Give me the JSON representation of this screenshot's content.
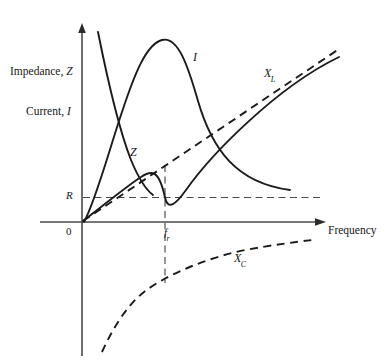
{
  "figure": {
    "type": "diagram",
    "title": "",
    "background_color": "#ffffff",
    "line_color": "#161616",
    "axis_color": "#4a4a4a"
  },
  "axes": {
    "x_axis": {
      "label": "Frequency",
      "arrow": true,
      "origin_label": "0"
    },
    "y_axis": {
      "labels": [
        {
          "text_static": "Impedance, ",
          "variable": "Z",
          "full": "Impedance, Z"
        },
        {
          "text_static": "Current, ",
          "variable": "I",
          "full": "Current, I"
        }
      ],
      "arrow": true
    },
    "tick_labels": {
      "y_resistance": "R",
      "x_resonance": "f",
      "x_resonance_sub": "r"
    }
  },
  "curves": [
    {
      "name": "impedance-z",
      "label": "Z",
      "style": "solid",
      "description": "U-shaped impedance curve with minimum equal to R at resonant frequency"
    },
    {
      "name": "current-i",
      "label": "I",
      "style": "solid",
      "description": "Bell-shaped current resonance curve peaking at resonant frequency"
    },
    {
      "name": "inductive-reactance-xl",
      "label": "X",
      "label_sub": "L",
      "style": "dashed",
      "description": "Straight line through origin rising with frequency"
    },
    {
      "name": "capacitive-reactance-xc",
      "label": "X",
      "label_sub": "C",
      "style": "dashed",
      "description": "Negative hyperbolic curve rising toward zero with frequency"
    }
  ],
  "guides": [
    {
      "name": "resistance-level-line",
      "style": "dashed",
      "from_label": "R"
    },
    {
      "name": "resonance-vertical-line",
      "style": "dashed",
      "from_label": "f_r"
    }
  ]
}
